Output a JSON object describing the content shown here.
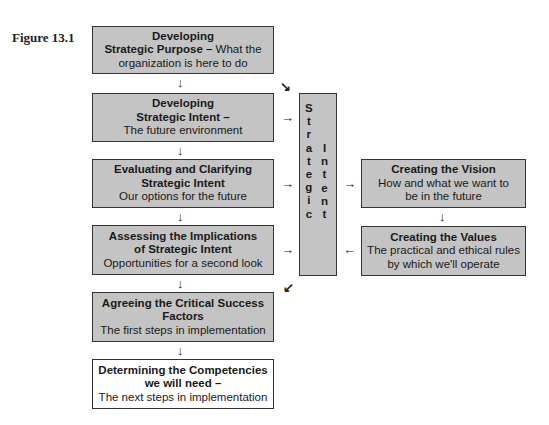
{
  "figure_label": "Figure 13.1",
  "left_column": [
    {
      "title": "Developing",
      "title2": "Strategic Purpose –",
      "subtitle": " What the",
      "subtitle2": "organization is here to do"
    },
    {
      "title": "Developing",
      "title2": "Strategic Intent –",
      "subtitle": "The future environment"
    },
    {
      "title": "Evaluating and Clarifying",
      "title2": "Strategic Intent",
      "subtitle": "Our options for the future"
    },
    {
      "title": "Assessing the Implications",
      "title2": "of Strategic Intent",
      "subtitle": "Opportunities for a second look"
    },
    {
      "title": "Agreeing the Critical Success",
      "title2": "Factors",
      "subtitle": "The first steps in implementation"
    },
    {
      "title": "Determining the Competencies",
      "title2": "we will need –",
      "subtitle": "The next steps in implementation"
    }
  ],
  "center_box": {
    "word1_letters": [
      "S",
      "t",
      "r",
      "a",
      "t",
      "e",
      "g",
      "i",
      "c"
    ],
    "word2_letters": [
      "I",
      "n",
      "t",
      "e",
      "n",
      "t"
    ]
  },
  "right_column": [
    {
      "title": "Creating the Vision",
      "subtitle": "How and what we want to",
      "subtitle2": "be in the future"
    },
    {
      "title": "Creating the Values",
      "subtitle": "The practical and ethical rules",
      "subtitle2": "by which we'll operate"
    }
  ],
  "arrows": {
    "down": "↓",
    "right": "→",
    "left": "←",
    "down_right": "↘",
    "down_left": "↙"
  },
  "colors": {
    "box_fill": "#c4c4c4",
    "border": "#333333",
    "final_box_fill": "#ffffff"
  }
}
